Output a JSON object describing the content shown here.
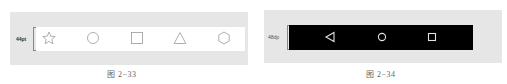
{
  "figures": [
    {
      "id": "fig-2-33",
      "caption": "图 2−33",
      "dimension_label": "44pt",
      "bar_color": "#ffffff",
      "icon_color": "#9a9a9a",
      "icons": [
        "star-icon",
        "circle-icon",
        "square-icon",
        "triangle-icon",
        "hexagon-icon"
      ]
    },
    {
      "id": "fig-2-34",
      "caption": "图 2−34",
      "dimension_label": "48dp",
      "bar_color": "#000000",
      "icon_color": "#e0e0e0",
      "icons": [
        "back-triangle-icon",
        "home-circle-icon",
        "recents-square-icon"
      ]
    }
  ]
}
